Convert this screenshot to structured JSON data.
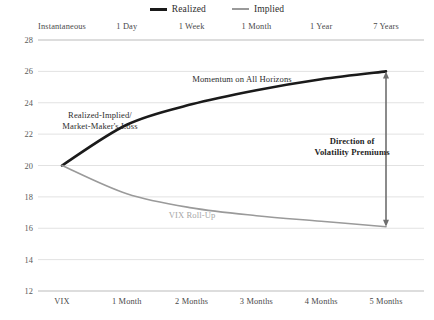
{
  "legend": {
    "items": [
      {
        "label": "Realized",
        "swatch": "realized",
        "color": "#1a1a1a"
      },
      {
        "label": "Implied",
        "swatch": "implied",
        "color": "#9a9a9a"
      }
    ]
  },
  "chart_data": {
    "type": "line",
    "title": "",
    "subtitle": "",
    "xlabel": "",
    "ylabel": "",
    "grid": true,
    "legend_position": "top-center",
    "ylim": [
      12,
      28
    ],
    "yticks": [
      28,
      26,
      24,
      22,
      20,
      18,
      16,
      14,
      12
    ],
    "ytick_labels": [
      "28",
      "26",
      "24",
      "22",
      "20",
      "18",
      "16",
      "14",
      "12"
    ],
    "categories": [
      "VIX",
      "1 Month",
      "2 Months",
      "3 Months",
      "4 Months",
      "5 Months"
    ],
    "top_axis_labels": [
      "Instantaneous",
      "1 Day",
      "1 Week",
      "1 Month",
      "1 Year",
      "7 Years"
    ],
    "series": [
      {
        "name": "Realized",
        "color": "#1a1a1a",
        "width": 2.6,
        "values": [
          20.0,
          22.6,
          23.9,
          24.8,
          25.5,
          26.0
        ]
      },
      {
        "name": "Implied",
        "color": "#9a9a9a",
        "width": 1.6,
        "values": [
          20.0,
          18.2,
          17.3,
          16.8,
          16.45,
          16.1
        ]
      }
    ],
    "annotations": [
      {
        "name": "momentum-annotation",
        "lines": [
          "Momentum on All Horizons"
        ],
        "x": 242,
        "y": 74,
        "style": "centered"
      },
      {
        "name": "realized-implied-annotation",
        "lines": [
          "Realized-Implied/",
          "Market-Maker's Loss"
        ],
        "x": 100,
        "y": 110,
        "style": "centered"
      },
      {
        "name": "direction-of-volatility-premiums-annotation",
        "lines": [
          "Direction of",
          "Volatility Premiums"
        ],
        "x": 352,
        "y": 136,
        "style": "centered bold"
      },
      {
        "name": "vix-roll-up-annotation",
        "lines": [
          "VIX Roll-Up"
        ],
        "x": 192,
        "y": 210,
        "style": "centered muted"
      }
    ],
    "arrow": {
      "name": "volatility-premium-arrow",
      "orientation": "vertical",
      "double_headed": true,
      "x_category": "5 Months",
      "y_top": 26.0,
      "y_bottom": 16.1,
      "color": "#6e6e6e"
    }
  }
}
